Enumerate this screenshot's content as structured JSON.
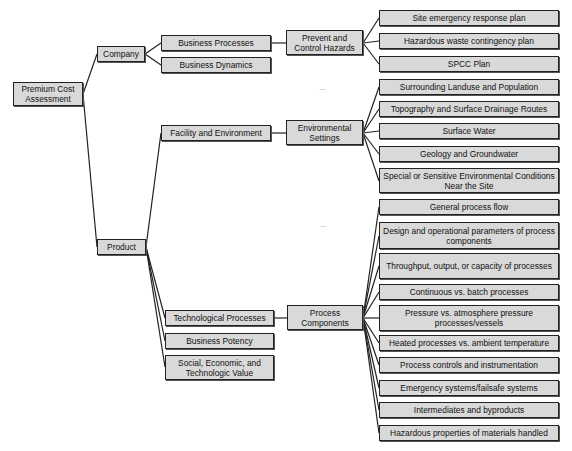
{
  "diagram": {
    "root": "Premium Cost Assessment",
    "level1": {
      "company": "Company",
      "product": "Product"
    },
    "level2": {
      "business_processes": "Business Processes",
      "business_dynamics": "Business Dynamics",
      "facility_environment": "Facility and Environment",
      "technological_processes": "Technological Processes",
      "business_potency": "Business Potency",
      "social_value": "Social, Economic, and Technologic Value"
    },
    "level3": {
      "prevent_control": "Prevent and Control Hazards",
      "environmental_settings": "Environmental Settings",
      "process_components": "Process Components"
    },
    "hazards_items": [
      "Site emergency response plan",
      "Hazardous waste contingency plan",
      "SPCC Plan"
    ],
    "environment_items": [
      "Surrounding Landuse and Population",
      "Topography and Surface Drainage Routes",
      "Surface Water",
      "Geology and Groundwater",
      "Special or Sensitive Environmental Conditions Near the Site"
    ],
    "process_items": [
      "General process flow",
      "Design and operational parameters of process components",
      "Throughput, output, or capacity of processes",
      "Continuous vs. batch processes",
      "Pressure vs. atmosphere pressure processes/vessels",
      "Heated processes vs. ambient temperature",
      "Process controls and instrumentation",
      "Emergency systems/failsafe systems",
      "Intermediates and byproducts",
      "Hazardous properties of materials handled"
    ],
    "ellipsis": "..."
  }
}
